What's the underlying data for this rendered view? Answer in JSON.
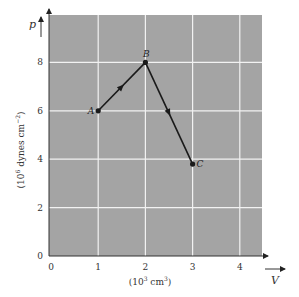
{
  "chart_data": {
    "type": "line",
    "title": "",
    "xlabel": "(10^3 cm^3)",
    "ylabel": "(10^6 dynes cm^-2)",
    "x_var": "V",
    "y_var": "p",
    "xlim": [
      0,
      4.5
    ],
    "ylim": [
      0,
      9
    ],
    "grid": true,
    "x_ticks": [
      "0",
      "1",
      "2",
      "3",
      "4"
    ],
    "y_ticks": [
      "0",
      "2",
      "4",
      "6",
      "8"
    ],
    "x_tick_values": [
      0,
      1,
      2,
      3,
      4
    ],
    "y_tick_values": [
      0,
      2,
      4,
      6,
      8
    ],
    "series": [
      {
        "name": "process path",
        "points": [
          {
            "label": "A",
            "x": 1,
            "y": 6
          },
          {
            "label": "B",
            "x": 2,
            "y": 8
          },
          {
            "label": "C",
            "x": 3,
            "y": 3.8
          }
        ],
        "direction_arrows": true
      }
    ],
    "colors": {
      "plot_background": "#a4a4a4",
      "grid": "#f2f2f2",
      "line": "#1a1a1a"
    }
  }
}
